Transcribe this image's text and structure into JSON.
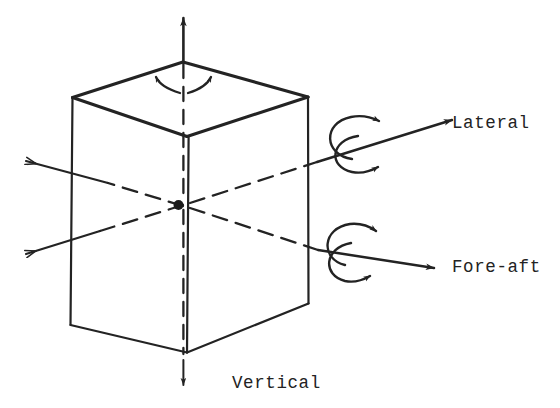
{
  "figure": {
    "kind": "axis-convention-diagram",
    "stroke_color": "#232323",
    "background_color": "#ffffff",
    "origin_marker": "filled-dot",
    "axes": [
      {
        "name": "vertical",
        "label": "Vertical",
        "label_x": 232,
        "label_y": 388,
        "direction": "up-down",
        "translation_arrows": [
          "up",
          "down"
        ],
        "rotation_arrows": 2,
        "rotation_style": "double-splay"
      },
      {
        "name": "lateral",
        "label": "Lateral",
        "label_x": 452,
        "label_y": 128,
        "direction": "lower-left-to-upper-right",
        "translation_arrows": [
          "right",
          "left"
        ],
        "rotation_arrows": 2,
        "rotation_style": "c-curve"
      },
      {
        "name": "fore-aft",
        "label": "Fore-aft",
        "label_x": 452,
        "label_y": 272,
        "direction": "upper-left-to-lower-right",
        "translation_arrows": [
          "right",
          "left"
        ],
        "rotation_arrows": 2,
        "rotation_style": "c-curve"
      }
    ],
    "box": {
      "top_face_vertices": "183,62 72,97 187,136 308,97",
      "front_left_edge": "72,97 70,325",
      "front_center_edge": "189,137 187,352",
      "front_right_edge": "308,97 308,303",
      "bottom_left_edge": "70,325 187,352",
      "bottom_right_edge": "187,352 308,303"
    }
  }
}
